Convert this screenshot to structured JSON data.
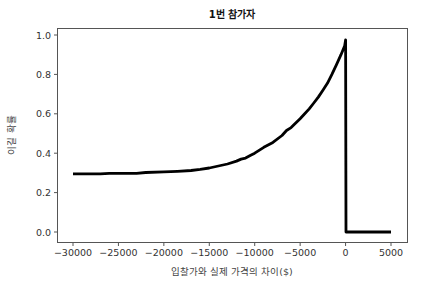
{
  "chart_data": {
    "type": "line",
    "title": "1번 참가자",
    "xlabel": "입찰가와 실제 가격의 차이($)",
    "ylabel": "이길 확률",
    "xlim": [
      -31500,
      6500
    ],
    "ylim": [
      -0.05,
      1.04
    ],
    "grid": false,
    "legend": null,
    "xticks": [
      -30000,
      -25000,
      -20000,
      -15000,
      -10000,
      -5000,
      0,
      5000
    ],
    "xtick_labels": [
      "−30000",
      "−25000",
      "−20000",
      "−15000",
      "−10000",
      "−5000",
      "0",
      "5000"
    ],
    "yticks": [
      0.0,
      0.2,
      0.4,
      0.6,
      0.8,
      1.0
    ],
    "ytick_labels": [
      "0.0",
      "0.2",
      "0.4",
      "0.6",
      "0.8",
      "1.0"
    ],
    "series": [
      {
        "name": "win probability",
        "color": "#000000",
        "x": [
          -30000,
          -27000,
          -26000,
          -23000,
          -22000,
          -20000,
          -18500,
          -17000,
          -16000,
          -15000,
          -14000,
          -13000,
          -12000,
          -11500,
          -11000,
          -10500,
          -10000,
          -9000,
          -8000,
          -7000,
          -6500,
          -6000,
          -5000,
          -4500,
          -4000,
          -3500,
          -3000,
          -2500,
          -2000,
          -1500,
          -1000,
          -500,
          -100,
          0,
          50,
          5000
        ],
        "y": [
          0.295,
          0.295,
          0.298,
          0.298,
          0.302,
          0.305,
          0.308,
          0.312,
          0.318,
          0.325,
          0.335,
          0.345,
          0.36,
          0.37,
          0.375,
          0.388,
          0.4,
          0.43,
          0.455,
          0.49,
          0.515,
          0.53,
          0.575,
          0.6,
          0.625,
          0.655,
          0.685,
          0.72,
          0.755,
          0.8,
          0.85,
          0.9,
          0.945,
          0.975,
          0.0,
          0.0
        ]
      }
    ]
  }
}
